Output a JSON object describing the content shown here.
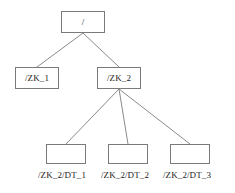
{
  "diagram": {
    "type": "tree",
    "orientation": "top-down",
    "background_color": "#ffffff",
    "node_fill_color": "#ffffff",
    "node_border_color": "#7a7a7a",
    "edge_color": "#8a8a8a",
    "text_color": "#1a1a1a"
  },
  "nodes": {
    "root": {
      "label": "/",
      "level": 0
    },
    "zk1": {
      "label": "/ZK_1",
      "level": 1
    },
    "zk2": {
      "label": "/ZK_2",
      "level": 1
    },
    "dt1": {
      "label": "",
      "caption": "/ZK_2/DT_1",
      "level": 2
    },
    "dt2": {
      "label": "",
      "caption": "/ZK_2/DT_2",
      "level": 2
    },
    "dt3": {
      "label": "",
      "caption": "/ZK_2/DT_3",
      "level": 2
    }
  },
  "edges": [
    {
      "from": "root",
      "to": "zk1"
    },
    {
      "from": "root",
      "to": "zk2"
    },
    {
      "from": "zk2",
      "to": "dt1"
    },
    {
      "from": "zk2",
      "to": "dt2"
    },
    {
      "from": "zk2",
      "to": "dt3"
    }
  ]
}
